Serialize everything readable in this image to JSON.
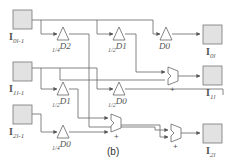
{
  "figure": {
    "caption": "(b)",
    "colors": {
      "line": "#555555",
      "box_fill": "#e2e2e2",
      "box_stroke": "#777777",
      "text": "#555555"
    }
  },
  "inputs": [
    {
      "base": "I",
      "index": "0",
      "sub": "l-1"
    },
    {
      "base": "I",
      "index": "1",
      "sub": "l-1"
    },
    {
      "base": "I",
      "index": "2",
      "sub": "l-1"
    }
  ],
  "outputs": [
    {
      "base": "I",
      "index": "0",
      "sub": "l"
    },
    {
      "base": "I",
      "index": "1",
      "sub": "l"
    },
    {
      "base": "I",
      "index": "2",
      "sub": "l"
    }
  ],
  "gains": [
    {
      "coef": "1/4",
      "label": "D2"
    },
    {
      "coef": "1/2",
      "label": "D1"
    },
    {
      "coef": "",
      "label": "D0"
    },
    {
      "coef": "1/2",
      "label": "D1"
    },
    {
      "coef": "1/2",
      "label": "D0"
    },
    {
      "coef": "1/4",
      "label": "D0"
    }
  ],
  "adders": [
    {
      "sign": "+"
    },
    {
      "sign": "+"
    },
    {
      "sign": "+"
    }
  ]
}
